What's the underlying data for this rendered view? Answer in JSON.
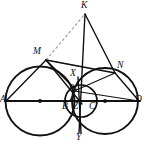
{
  "figure": {
    "colors": {
      "stroke": "#111111",
      "dashed": "#9a9a9a",
      "background": "#ffffff",
      "label": "#101010"
    },
    "baseline": {
      "label": "AD",
      "from": "A",
      "to": "D",
      "y": 101
    },
    "points": [
      {
        "id": "K",
        "label": "K",
        "x": 85,
        "y": 14,
        "label_x": 81,
        "label_y": 2,
        "size": "normal"
      },
      {
        "id": "M",
        "label": "M",
        "x": 46,
        "y": 60,
        "label_x": 33,
        "label_y": 48,
        "size": "normal"
      },
      {
        "id": "N",
        "label": "N",
        "x": 115,
        "y": 73,
        "label_x": 117,
        "label_y": 62,
        "size": "normal"
      },
      {
        "id": "X",
        "label": "X",
        "x": 78,
        "y": 77,
        "label_x": 71,
        "label_y": 70,
        "size": "normal"
      },
      {
        "id": "P",
        "label": "P",
        "x": 76,
        "y": 90,
        "label_x": 70,
        "label_y": 84,
        "size": "small"
      },
      {
        "id": "A",
        "label": "A",
        "x": 6,
        "y": 101,
        "label_x": 1,
        "label_y": 95,
        "size": "normal"
      },
      {
        "id": "B",
        "label": "B",
        "x": 70,
        "y": 101,
        "label_x": 62,
        "label_y": 102,
        "size": "normal"
      },
      {
        "id": "Z",
        "label": "Z",
        "x": 79,
        "y": 101,
        "label_x": 73,
        "label_y": 102,
        "size": "normal"
      },
      {
        "id": "C",
        "label": "C",
        "x": 94,
        "y": 101,
        "label_x": 89,
        "label_y": 102,
        "size": "normal"
      },
      {
        "id": "D",
        "label": "D",
        "x": 139,
        "y": 101,
        "label_x": 136,
        "label_y": 95,
        "size": "normal"
      },
      {
        "id": "Y",
        "label": "Y",
        "x": 81,
        "y": 133,
        "label_x": 77,
        "label_y": 134,
        "size": "normal"
      }
    ],
    "circles": [
      {
        "id": "circle-AB",
        "name": "large-left-circle",
        "cx": 40,
        "cy": 101,
        "r": 34.5,
        "center_dot": true
      },
      {
        "id": "circle-CD",
        "name": "right-circle",
        "cx": 105,
        "cy": 101,
        "r": 33.0,
        "center_dot": true
      },
      {
        "id": "circle-BC",
        "name": "small-middle-circle",
        "cx": 81,
        "cy": 101,
        "r": 16.0,
        "center_dot": false
      }
    ],
    "segments": [
      {
        "id": "seg-AD",
        "name": "diameter-line-AD",
        "from": "A",
        "to": "D",
        "style": "solid",
        "width": 1.8
      },
      {
        "id": "seg-AM",
        "name": "segment-AM",
        "from": "A",
        "to": "M",
        "style": "solid",
        "width": 1.3
      },
      {
        "id": "seg-MK",
        "name": "segment-MK",
        "from": "M",
        "to": "K",
        "style": "solid",
        "width": 1.3
      },
      {
        "id": "seg-KZ",
        "name": "segment-KZ",
        "from": "K",
        "to": "Z",
        "style": "solid",
        "width": 1.3
      },
      {
        "id": "seg-KN",
        "name": "segment-KN",
        "from": "K",
        "to": "N",
        "style": "solid",
        "width": 1.3
      },
      {
        "id": "seg-ND",
        "name": "segment-ND",
        "from": "N",
        "to": "D",
        "style": "solid",
        "width": 1.3
      },
      {
        "id": "seg-MZ",
        "name": "segment-MZ",
        "from": "M",
        "to": "Z",
        "style": "solid",
        "width": 1.3
      },
      {
        "id": "seg-MN",
        "name": "segment-MN",
        "from": "M",
        "to": "N",
        "style": "solid",
        "width": 1.3
      },
      {
        "id": "seg-PN",
        "name": "segment-PN",
        "from": "P",
        "to": "N",
        "style": "solid",
        "width": 1.1
      },
      {
        "id": "seg-XY",
        "name": "chord-XY",
        "from": "X",
        "to": "Y",
        "style": "solid",
        "width": 1.3
      },
      {
        "id": "seg-PD",
        "name": "segment-PD",
        "from": "P",
        "to": "D",
        "style": "solid",
        "width": 1.1
      },
      {
        "id": "seg-BP",
        "name": "segment-BP",
        "from": "B",
        "to": "P",
        "style": "solid",
        "width": 1.1
      },
      {
        "id": "seg-MK-dash",
        "name": "dashed-segment-MK",
        "from": "M",
        "to": "K",
        "style": "dashed",
        "width": 1.0
      },
      {
        "id": "seg-MN-dash",
        "name": "dashed-segment-MN",
        "from": "M",
        "to": "N",
        "style": "dashed",
        "width": 1.0
      }
    ]
  }
}
